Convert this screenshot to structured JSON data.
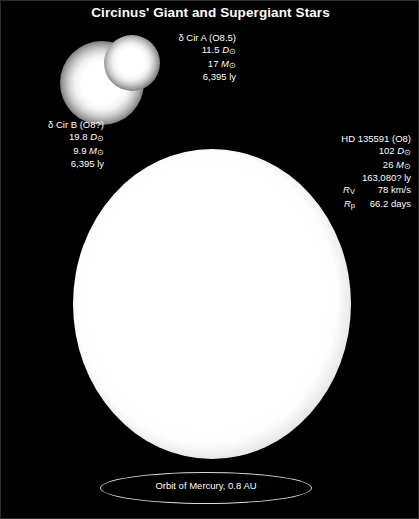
{
  "figure": {
    "title": "Circinus' Giant and Supergiant Stars",
    "background_color": "#000000",
    "text_color": "#ffffff"
  },
  "stars": {
    "delta_cir_a": {
      "name": "δ Cir A (O8.5)",
      "diameter": "11.5",
      "diameter_unit_symbol": "D",
      "diameter_unit_subscript": "⊙",
      "mass": "17",
      "mass_unit_symbol": "M",
      "mass_unit_subscript": "⊙",
      "distance": "6,395 ly"
    },
    "delta_cir_b": {
      "name": "δ Cir B (O8?)",
      "diameter": "19.8",
      "diameter_unit_symbol": "D",
      "diameter_unit_subscript": "⊙",
      "mass": "9.9",
      "mass_unit_symbol": "M",
      "mass_unit_subscript": "⊙",
      "distance": "6,395 ly"
    },
    "hd_135591": {
      "name": "HD 135591 (O8)",
      "diameter": "102",
      "diameter_unit_symbol": "D",
      "diameter_unit_subscript": "⊙",
      "mass": "26",
      "mass_unit_symbol": "M",
      "mass_unit_subscript": "⊙",
      "distance": "163,080? ly",
      "rotation_velocity_symbol": "R",
      "rotation_velocity_subscript": "V",
      "rotation_velocity_value": "78 km/s",
      "rotation_period_symbol": "R",
      "rotation_period_subscript": "p",
      "rotation_period_value": "66.2 days"
    }
  },
  "orbit_reference": {
    "label": "Orbit of Mercury, 0.8 AU"
  },
  "chart_data": {
    "type": "scatter",
    "title": "Circinus' Giant and Supergiant Stars",
    "xlabel": "",
    "ylabel": "",
    "units": {
      "diameter": "solar diameters (D⊙)",
      "mass": "solar masses (M⊙)",
      "distance": "light years (ly)"
    },
    "series": [
      {
        "name": "δ Cir A (O8.5)",
        "diameter_solar": 11.5,
        "mass_solar": 17,
        "distance_ly": 6395,
        "render": {
          "cx": 131,
          "cy": 62,
          "r": 28
        }
      },
      {
        "name": "δ Cir B (O8?)",
        "diameter_solar": 19.8,
        "mass_solar": 9.9,
        "distance_ly": 6395,
        "render": {
          "cx": 101,
          "cy": 82,
          "r": 42
        }
      },
      {
        "name": "HD 135591 (O8)",
        "diameter_solar": 102,
        "mass_solar": 26,
        "distance_ly": 163080,
        "rotation_velocity_km_s": 78,
        "rotation_period_days": 66.2,
        "render": {
          "cx": 211,
          "cy": 303,
          "rx": 139,
          "ry": 155
        }
      }
    ],
    "annotations": [
      {
        "label": "Orbit of Mercury, 0.8 AU",
        "au": 0.8,
        "shape": "ellipse"
      }
    ]
  }
}
